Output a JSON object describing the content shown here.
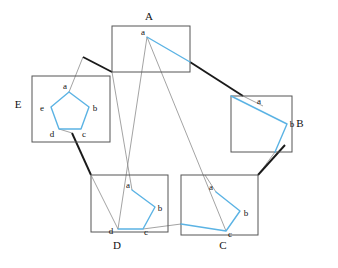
{
  "figure": {
    "width": 338,
    "height": 268,
    "background": "#ffffff",
    "colors": {
      "polygon_stroke": "#5bb3e4",
      "box_stroke": "#555555",
      "connector_thick": "#1a1a1a",
      "connector_thin": "#8c8c8c",
      "label_text": "#111111"
    }
  },
  "boxes": [
    {
      "id": "A",
      "label": "A",
      "label_x": 149,
      "label_y": 20,
      "rect": {
        "x": 112,
        "y": 26,
        "w": 78,
        "h": 46
      },
      "vertices": [
        {
          "name": "a",
          "x": 147,
          "y": 37,
          "label_x": 143,
          "label_y": 35
        }
      ],
      "polyline": "147,37 190,62"
    },
    {
      "id": "B",
      "label": "B",
      "label_x": 300,
      "label_y": 127,
      "rect": {
        "x": 231,
        "y": 96,
        "w": 61,
        "h": 56
      },
      "vertices": [
        {
          "name": "a",
          "x": 263,
          "y": 106,
          "label_x": 259,
          "label_y": 103
        },
        {
          "name": "b",
          "x": 287,
          "y": 124,
          "label_x": 292,
          "label_y": 127
        }
      ],
      "polyline": "231,96 287,124 275,152"
    },
    {
      "id": "C",
      "label": "C",
      "label_x": 223,
      "label_y": 249,
      "rect": {
        "x": 181,
        "y": 175,
        "w": 77,
        "h": 60
      },
      "vertices": [
        {
          "name": "a",
          "x": 216,
          "y": 192,
          "label_x": 211,
          "label_y": 189
        },
        {
          "name": "b",
          "x": 240,
          "y": 211,
          "label_x": 245,
          "label_y": 215
        },
        {
          "name": "c",
          "x": 226,
          "y": 231,
          "label_x": 230,
          "label_y": 235
        }
      ],
      "polyline": "216,192 240,211 226,231 181,224"
    },
    {
      "id": "D",
      "label": "D",
      "label_x": 117,
      "label_y": 249,
      "rect": {
        "x": 91,
        "y": 175,
        "w": 77,
        "h": 57
      },
      "vertices": [
        {
          "name": "a",
          "x": 132,
          "y": 190,
          "label_x": 128,
          "label_y": 187
        },
        {
          "name": "b",
          "x": 155,
          "y": 207,
          "label_x": 159,
          "label_y": 210
        },
        {
          "name": "c",
          "x": 143,
          "y": 229,
          "label_x": 146,
          "label_y": 233
        },
        {
          "name": "d",
          "x": 118,
          "y": 229,
          "label_x": 112,
          "label_y": 233
        }
      ],
      "polyline": "132,190 155,207 143,229 118,229 91,175"
    },
    {
      "id": "E",
      "label": "E",
      "label_x": 18,
      "label_y": 108,
      "rect": {
        "x": 32,
        "y": 76,
        "w": 78,
        "h": 66
      },
      "vertices": [
        {
          "name": "a",
          "x": 69,
          "y": 92,
          "label_x": 65,
          "label_y": 89
        },
        {
          "name": "b",
          "x": 89,
          "y": 107,
          "label_x": 93,
          "label_y": 110
        },
        {
          "name": "c",
          "x": 81,
          "y": 129,
          "label_x": 84,
          "label_y": 135
        },
        {
          "name": "d",
          "x": 59,
          "y": 129,
          "label_x": 52,
          "label_y": 135
        },
        {
          "name": "e",
          "x": 51,
          "y": 107,
          "label_x": 43,
          "label_y": 110
        }
      ],
      "polyline": "69,92 89,107 81,129 59,129 51,107 69,92"
    }
  ],
  "connectors": {
    "thick": [
      {
        "from": "A",
        "to": "E",
        "path": "112,72 83,57",
        "comment": "A bottom-left to E top-right"
      },
      {
        "from": "A",
        "to": "B",
        "path": "190,62 243,96"
      },
      {
        "from": "B",
        "to": "C",
        "path": "285,145 258,175"
      },
      {
        "from": "E",
        "to": "D",
        "path": "72,133 91,175"
      }
    ],
    "thin": [
      {
        "from": "A",
        "to": "D",
        "path": "147,37 118,229"
      },
      {
        "from": "A",
        "to": "C",
        "path": "147,37 226,231"
      },
      {
        "from": "D",
        "to": "C",
        "path": "143,229 181,224"
      },
      {
        "from": "E",
        "to": "A",
        "path": "83,57 69,92"
      },
      {
        "from": "B",
        "to": "A",
        "path": "243,96 263,106"
      },
      {
        "from": "B",
        "to": "C",
        "path": "275,152 258,175"
      },
      {
        "from": "E",
        "to": "D",
        "path": "59,129 72,133"
      },
      {
        "from": "D",
        "to": "A",
        "path": "132,190 112,72"
      }
    ]
  },
  "vertex_names": [
    "a",
    "b",
    "c",
    "d",
    "e"
  ]
}
